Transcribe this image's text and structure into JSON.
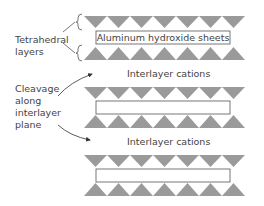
{
  "labels": {
    "tetrahedral": "Tetrahedral layers",
    "tetrahedral_line1": "Tetrahedral",
    "tetrahedral_line2": "layers",
    "cleavage_line1": "Cleavage",
    "cleavage_line2": "along",
    "cleavage_line3": "interlayer",
    "cleavage_line4": "plane",
    "sheet": "Aluminum hydroxide sheets",
    "cation1": "Interlayer cations",
    "cation2": "Interlayer cations"
  },
  "colors": {
    "triangle": "#9a9a9a",
    "outline": "#555555",
    "text": "#444444"
  },
  "structure": {
    "units": 3,
    "triangles_per_row": 7
  }
}
